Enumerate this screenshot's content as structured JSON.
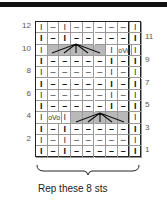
{
  "chart": {
    "caption": "Rep these 8 sts",
    "left_row_numbers": [
      "12",
      "10",
      "8",
      "6",
      "4",
      "2"
    ],
    "right_row_numbers": [
      "11",
      "9",
      "7",
      "5",
      "3",
      "1"
    ],
    "rows": [
      {
        "row": 12,
        "cells": [
          "I",
          "–",
          "I",
          "–",
          "–",
          "–",
          "–",
          "–",
          "I"
        ]
      },
      {
        "row": 11,
        "cells": [
          "I",
          "–",
          "I",
          "–",
          "–",
          "–",
          "–",
          "–",
          "I"
        ]
      },
      {
        "row": 10,
        "cells": [
          "I",
          "",
          "",
          "",
          "",
          "",
          "I",
          "oVo",
          "I"
        ]
      },
      {
        "row": 9,
        "cells": [
          "I",
          "–",
          "–",
          "–",
          "–",
          "–",
          "I",
          "–",
          "I"
        ]
      },
      {
        "row": 8,
        "cells": [
          "I",
          "–",
          "–",
          "–",
          "–",
          "–",
          "I",
          "–",
          "I"
        ]
      },
      {
        "row": 7,
        "cells": [
          "I",
          "–",
          "–",
          "–",
          "–",
          "–",
          "I",
          "–",
          "I"
        ]
      },
      {
        "row": 6,
        "cells": [
          "I",
          "–",
          "–",
          "–",
          "–",
          "–",
          "I",
          "–",
          "I"
        ]
      },
      {
        "row": 5,
        "cells": [
          "I",
          "–",
          "–",
          "–",
          "–",
          "–",
          "I",
          "–",
          "I"
        ]
      },
      {
        "row": 4,
        "cells": [
          "I",
          "oVo",
          "I",
          "",
          "",
          "",
          "",
          "",
          "I"
        ]
      },
      {
        "row": 3,
        "cells": [
          "I",
          "–",
          "I",
          "–",
          "–",
          "–",
          "–",
          "–",
          "I"
        ]
      },
      {
        "row": 2,
        "cells": [
          "I",
          "–",
          "I",
          "–",
          "–",
          "–",
          "–",
          "–",
          "I"
        ]
      },
      {
        "row": 1,
        "cells": [
          "I",
          "–",
          "I",
          "–",
          "–",
          "–",
          "–",
          "–",
          "I"
        ]
      }
    ]
  }
}
